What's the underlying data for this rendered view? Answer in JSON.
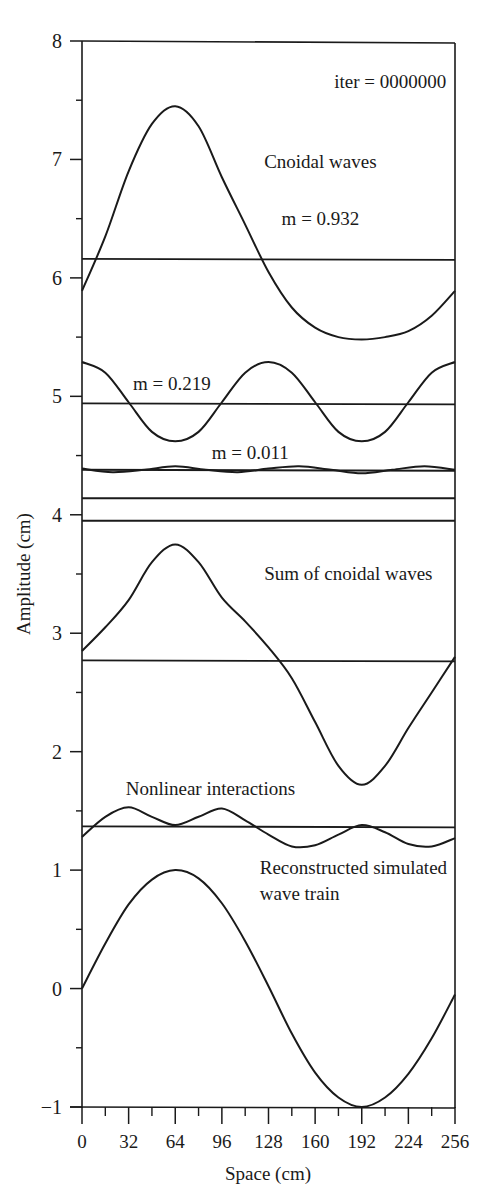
{
  "chart_data": {
    "type": "line",
    "title": "",
    "xlabel": "Space (cm)",
    "ylabel": "Amplitude (cm)",
    "xlim": [
      0,
      256
    ],
    "ylim": [
      -1,
      8
    ],
    "x_ticks": [
      0,
      32,
      64,
      96,
      128,
      160,
      192,
      224,
      256
    ],
    "x_minor_ticks": [
      16,
      48,
      80,
      112,
      144,
      176,
      208,
      240
    ],
    "y_ticks": [
      -1,
      0,
      1,
      2,
      3,
      4,
      5,
      6,
      7,
      8
    ],
    "y_minor_ticks": [
      -0.5,
      0.5,
      1.5,
      2.5,
      3.5,
      4.5,
      5.5,
      6.5,
      7.5
    ],
    "grid": false,
    "legend": null,
    "annotations": [
      {
        "text": "iter = 0000000",
        "x": 250,
        "y": 7.6,
        "anchor": "end"
      },
      {
        "text": "Cnoidal waves",
        "x": 125,
        "y": 6.93,
        "anchor": "start"
      },
      {
        "text": "m = 0.932",
        "x": 137,
        "y": 6.45,
        "anchor": "start"
      },
      {
        "text": "m = 0.219",
        "x": 35,
        "y": 5.05,
        "anchor": "start"
      },
      {
        "text": "m = 0.011",
        "x": 89,
        "y": 4.47,
        "anchor": "start"
      },
      {
        "text": "Sum of cnoidal waves",
        "x": 125,
        "y": 3.45,
        "anchor": "start"
      },
      {
        "text": "Nonlinear interactions",
        "x": 30,
        "y": 1.63,
        "anchor": "start"
      },
      {
        "text": "Reconstructed simulated",
        "x": 122,
        "y": 0.97,
        "anchor": "start"
      },
      {
        "text": "wave train",
        "x": 122,
        "y": 0.75,
        "anchor": "start"
      }
    ],
    "series": [
      {
        "name": "Cnoidal wave m = 0.932",
        "baseline": 6.16,
        "x": [
          0,
          16,
          32,
          48,
          64,
          80,
          96,
          112,
          128,
          144,
          160,
          176,
          192,
          208,
          224,
          240,
          256
        ],
        "y": [
          5.89,
          6.35,
          6.9,
          7.3,
          7.45,
          7.28,
          6.85,
          6.45,
          6.05,
          5.75,
          5.58,
          5.5,
          5.48,
          5.5,
          5.55,
          5.68,
          5.89
        ]
      },
      {
        "name": "Cnoidal wave m = 0.219",
        "baseline": 4.94,
        "x": [
          0,
          16,
          32,
          48,
          64,
          80,
          96,
          112,
          128,
          144,
          160,
          176,
          192,
          208,
          224,
          240,
          256
        ],
        "y": [
          5.29,
          5.2,
          4.95,
          4.7,
          4.62,
          4.7,
          4.95,
          5.2,
          5.29,
          5.2,
          4.95,
          4.7,
          4.62,
          4.7,
          4.95,
          5.2,
          5.29
        ]
      },
      {
        "name": "Cnoidal wave m = 0.011",
        "baseline": 4.38,
        "x": [
          0,
          21,
          43,
          64,
          85,
          107,
          128,
          149,
          171,
          192,
          213,
          235,
          256
        ],
        "y": [
          4.39,
          4.36,
          4.38,
          4.41,
          4.38,
          4.36,
          4.39,
          4.41,
          4.38,
          4.35,
          4.38,
          4.41,
          4.38
        ]
      },
      {
        "name": "Reference line",
        "baseline": 4.14,
        "x": [
          0,
          256
        ],
        "y": [
          4.14,
          4.14
        ]
      },
      {
        "name": "Reference line",
        "baseline": 3.95,
        "x": [
          0,
          256
        ],
        "y": [
          3.95,
          3.95
        ]
      },
      {
        "name": "Sum of cnoidal waves",
        "baseline": 2.77,
        "x": [
          0,
          16,
          32,
          48,
          64,
          80,
          96,
          112,
          128,
          144,
          160,
          176,
          192,
          208,
          224,
          240,
          256
        ],
        "y": [
          2.85,
          3.05,
          3.28,
          3.6,
          3.75,
          3.6,
          3.3,
          3.1,
          2.88,
          2.62,
          2.25,
          1.88,
          1.72,
          1.88,
          2.2,
          2.5,
          2.8
        ]
      },
      {
        "name": "Nonlinear interactions",
        "baseline": 1.37,
        "x": [
          0,
          16,
          32,
          48,
          64,
          80,
          96,
          112,
          128,
          144,
          160,
          176,
          192,
          208,
          224,
          240,
          256
        ],
        "y": [
          1.28,
          1.45,
          1.53,
          1.45,
          1.38,
          1.45,
          1.52,
          1.42,
          1.3,
          1.2,
          1.21,
          1.3,
          1.38,
          1.32,
          1.22,
          1.2,
          1.27
        ]
      },
      {
        "name": "Reconstructed simulated wave train",
        "x": [
          0,
          16,
          32,
          48,
          64,
          80,
          96,
          112,
          128,
          144,
          160,
          176,
          192,
          208,
          224,
          240,
          256
        ],
        "y": [
          0,
          0.38,
          0.71,
          0.92,
          1.0,
          0.93,
          0.72,
          0.4,
          0.02,
          -0.38,
          -0.71,
          -0.92,
          -1.0,
          -0.92,
          -0.72,
          -0.42,
          -0.05
        ]
      }
    ]
  }
}
